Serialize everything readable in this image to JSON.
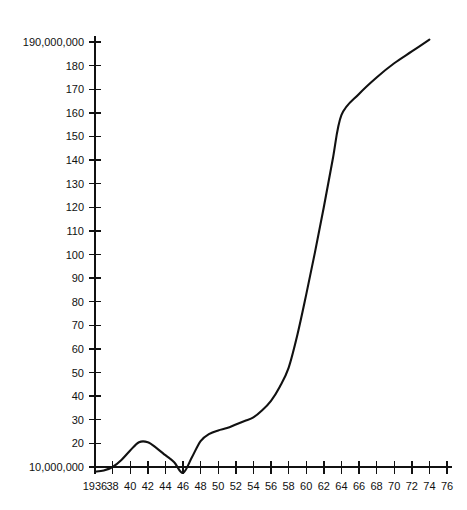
{
  "chart_data": {
    "type": "line",
    "title": "",
    "xlabel": "",
    "ylabel": "",
    "xlim": [
      1936,
      1976
    ],
    "ylim": [
      5,
      195
    ],
    "grid": false,
    "legend": null,
    "y_axis_unit_note": "values in tens of millions; first and last ticks written in full",
    "x_tick_labels": [
      "1936",
      "38",
      "40",
      "42",
      "44",
      "46",
      "48",
      "50",
      "52",
      "54",
      "56",
      "58",
      "60",
      "62",
      "64",
      "66",
      "68",
      "70",
      "72",
      "74",
      "76"
    ],
    "x_tick_values": [
      1936,
      1938,
      1940,
      1942,
      1944,
      1946,
      1948,
      1950,
      1952,
      1954,
      1956,
      1958,
      1960,
      1962,
      1964,
      1966,
      1968,
      1970,
      1972,
      1974,
      1976
    ],
    "y_tick_labels": [
      "10,000,000",
      "20",
      "30",
      "40",
      "50",
      "60",
      "70",
      "80",
      "90",
      "100",
      "110",
      "120",
      "130",
      "140",
      "150",
      "160",
      "170",
      "180",
      "190,000,000"
    ],
    "y_tick_values": [
      10,
      20,
      30,
      40,
      50,
      60,
      70,
      80,
      90,
      100,
      110,
      120,
      130,
      140,
      150,
      160,
      170,
      180,
      190
    ],
    "x": [
      1936,
      1937,
      1938,
      1939,
      1940,
      1941,
      1942,
      1943,
      1944,
      1945,
      1946,
      1947,
      1948,
      1949,
      1950,
      1951,
      1952,
      1953,
      1954,
      1955,
      1956,
      1957,
      1958,
      1959,
      1960,
      1961,
      1962,
      1963,
      1964,
      1966,
      1968,
      1970,
      1972,
      1974
    ],
    "values": [
      8,
      8.5,
      10,
      13,
      17,
      20.5,
      20.5,
      18,
      15,
      12,
      7.5,
      14,
      21,
      24,
      25.5,
      26.5,
      28,
      29.5,
      31,
      34,
      38,
      44,
      52,
      66,
      83,
      101,
      120,
      140,
      159,
      168,
      175,
      181,
      186,
      191
    ],
    "series": [
      {
        "name": "series-1",
        "values": [
          8,
          8.5,
          10,
          13,
          17,
          20.5,
          20.5,
          18,
          15,
          12,
          7.5,
          14,
          21,
          24,
          25.5,
          26.5,
          28,
          29.5,
          31,
          34,
          38,
          44,
          52,
          66,
          83,
          101,
          120,
          140,
          159,
          168,
          175,
          181,
          186,
          191
        ]
      }
    ],
    "annotations": [
      {
        "label": "local-peak",
        "x": 1941.5,
        "y": 20.8
      },
      {
        "label": "local-minimum",
        "x": 1946,
        "y": 7.5
      },
      {
        "label": "slope-kink",
        "x": 1964,
        "y": 159
      },
      {
        "label": "series-end",
        "x": 1974,
        "y": 191
      }
    ],
    "line_color": "#111111"
  },
  "plot_geometry": {
    "left": 95,
    "right": 447,
    "top": 42,
    "bottom": 467,
    "y_value_top": 190,
    "y_value_bottom": 10,
    "x_value_left": 1936,
    "x_value_right": 1976
  }
}
